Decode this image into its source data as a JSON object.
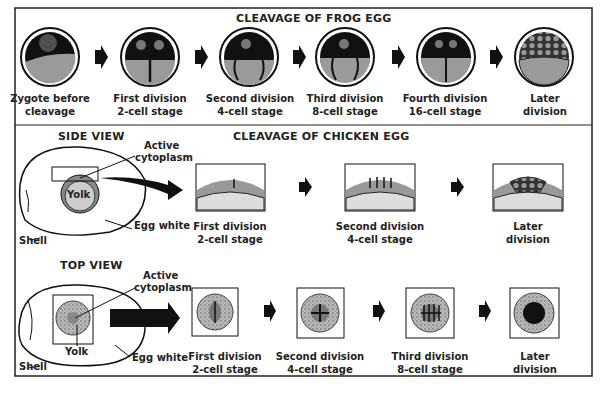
{
  "diagram": {
    "frog": {
      "title": "CLEAVAGE OF FROG EGG",
      "stages": [
        {
          "line1": "Zygote before",
          "line2": "cleavage"
        },
        {
          "line1": "First division",
          "line2": "2-cell stage"
        },
        {
          "line1": "Second division",
          "line2": "4-cell stage"
        },
        {
          "line1": "Third division",
          "line2": "8-cell stage"
        },
        {
          "line1": "Fourth division",
          "line2": "16-cell stage"
        },
        {
          "line1": "Later",
          "line2": "division"
        }
      ]
    },
    "chicken": {
      "title": "CLEAVAGE OF CHICKEN EGG",
      "side_view": {
        "title": "SIDE VIEW",
        "labels": {
          "active": "Active",
          "cytoplasm": "cytoplasm",
          "yolk": "Yolk",
          "egg_white": "Egg white",
          "shell": "Shell"
        },
        "stages": [
          {
            "line1": "First division",
            "line2": "2-cell stage"
          },
          {
            "line1": "Second division",
            "line2": "4-cell stage"
          },
          {
            "line1": "Later",
            "line2": "division"
          }
        ]
      },
      "top_view": {
        "title": "TOP VIEW",
        "labels": {
          "active": "Active",
          "cytoplasm": "cytoplasm",
          "yolk": "Yolk",
          "egg_white": "Egg white",
          "shell": "Shell"
        },
        "stages": [
          {
            "line1": "First division",
            "line2": "2-cell stage"
          },
          {
            "line1": "Second division",
            "line2": "4-cell stage"
          },
          {
            "line1": "Third division",
            "line2": "8-cell stage"
          },
          {
            "line1": "Later",
            "line2": "division"
          }
        ]
      }
    }
  }
}
